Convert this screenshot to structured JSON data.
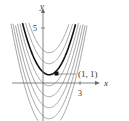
{
  "chart_data": {
    "type": "line",
    "title": "",
    "xlabel": "x",
    "ylabel": "y",
    "x_ticks": [
      {
        "value": 3,
        "label": "3"
      }
    ],
    "y_ticks": [
      {
        "value": 5,
        "label": "5"
      }
    ],
    "xlim": [
      -3.5,
      3.5
    ],
    "ylim": [
      -3.5,
      5.5
    ],
    "grid": false,
    "series": [
      {
        "name": "C=-4",
        "constant": -4,
        "highlight": false
      },
      {
        "name": "C=-3",
        "constant": -3,
        "highlight": false
      },
      {
        "name": "C=-2",
        "constant": -2,
        "highlight": false
      },
      {
        "name": "C=-1",
        "constant": -1,
        "highlight": false
      },
      {
        "name": "C=0",
        "constant": 0,
        "highlight": false
      },
      {
        "name": "C=1",
        "constant": 1,
        "highlight": true
      },
      {
        "name": "C=2",
        "constant": 2,
        "highlight": false
      },
      {
        "name": "C=3",
        "constant": 3,
        "highlight": false
      }
    ],
    "annotations": [
      {
        "text": "(1, 1)",
        "x": 1,
        "y": 1
      }
    ]
  },
  "labels": {
    "x_axis": "x",
    "y_axis": "y",
    "x_tick": "3",
    "y_tick": "5",
    "point": "(1, 1)"
  }
}
